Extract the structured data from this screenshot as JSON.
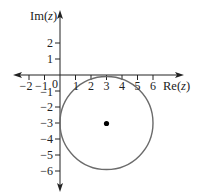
{
  "diagram": {
    "type": "complex-plane",
    "axes": {
      "x_label": "Re(z)",
      "x_label_func": "Re(",
      "x_label_var": "z",
      "x_label_close": ")",
      "y_label": "Im(z)",
      "y_label_func": "Im(",
      "y_label_var": "z",
      "y_label_close": ")",
      "x_ticks": [
        "−2",
        "−1",
        "1",
        "2",
        "3",
        "4",
        "5",
        "6"
      ],
      "y_ticks": [
        "2",
        "1",
        "−1",
        "−2",
        "−3",
        "−4",
        "−5",
        "−6"
      ],
      "origin_label": "0"
    },
    "circle": {
      "center": [
        3,
        -3
      ],
      "radius": 3,
      "stroke_color": "#6b6b6b"
    },
    "center_point": {
      "coords": [
        3,
        -3
      ],
      "color": "#000000"
    },
    "colors": {
      "axis": "#222222",
      "text": "#222222"
    }
  }
}
